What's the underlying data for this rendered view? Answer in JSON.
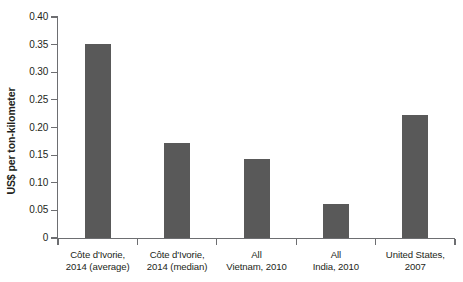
{
  "chart_data": {
    "type": "bar",
    "title": "",
    "xlabel": "",
    "ylabel": "US$ per ton-kilometer",
    "ylim": [
      0,
      0.4
    ],
    "ytick_step": 0.05,
    "grid": false,
    "legend": null,
    "bar_color": "#595959",
    "axis_color": "#6d6e71",
    "categories": [
      "Côte d'Ivorie, 2014 (average)",
      "Côte d'Ivorie, 2014 (median)",
      "All Vietnam, 2010",
      "All India, 2010",
      "United States, 2007"
    ],
    "category_lines": [
      [
        "Côte d'Ivorie,",
        "2014 (average)"
      ],
      [
        "Côte d'Ivorie,",
        "2014 (median)"
      ],
      [
        "All",
        "Vietnam, 2010"
      ],
      [
        "All",
        "India, 2010"
      ],
      [
        "United States,",
        "2007"
      ]
    ],
    "values": [
      0.352,
      0.172,
      0.143,
      0.062,
      0.223
    ],
    "ytick_labels": [
      "0.40",
      "0.35",
      "0.30",
      "0.25",
      "0.20",
      "0.15",
      "0.10",
      "0.05",
      "0"
    ],
    "ytick_values": [
      0.4,
      0.35,
      0.3,
      0.25,
      0.2,
      0.15,
      0.1,
      0.05,
      0
    ]
  }
}
